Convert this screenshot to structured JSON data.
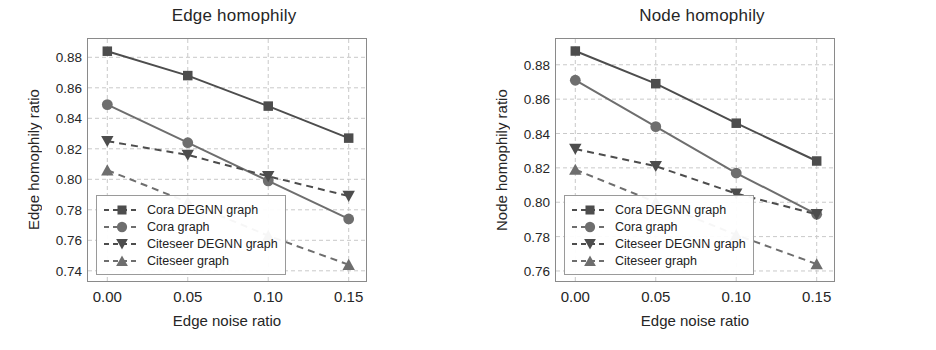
{
  "figure": {
    "panels": [
      "edge",
      "node"
    ]
  },
  "chart_data": [
    {
      "type": "line",
      "id": "edge",
      "title": "Edge homophily",
      "xlabel": "Edge noise ratio",
      "ylabel": "Edge homophily ratio",
      "x": [
        0.0,
        0.05,
        0.1,
        0.15
      ],
      "xticks": [
        "0.00",
        "0.05",
        "0.10",
        "0.15"
      ],
      "yticks": [
        "0.74",
        "0.76",
        "0.78",
        "0.80",
        "0.82",
        "0.84",
        "0.86",
        "0.88"
      ],
      "ylim": [
        0.732,
        0.892
      ],
      "xlim": [
        -0.012,
        0.162
      ],
      "grid": true,
      "legend_position": "lower left",
      "series": [
        {
          "name": "Cora DEGNN graph",
          "values": [
            0.884,
            0.868,
            0.848,
            0.827
          ],
          "marker": "square",
          "linestyle": "solid",
          "color": "#4d4d4d"
        },
        {
          "name": "Cora graph",
          "values": [
            0.849,
            0.824,
            0.799,
            0.774
          ],
          "marker": "circle",
          "linestyle": "solid",
          "color": "#6e6e6e"
        },
        {
          "name": "Citeseer DEGNN graph",
          "values": [
            0.825,
            0.816,
            0.802,
            0.789
          ],
          "marker": "triangle-down",
          "linestyle": "dashed",
          "color": "#4d4d4d"
        },
        {
          "name": "Citeseer graph",
          "values": [
            0.806,
            0.785,
            0.763,
            0.744
          ],
          "marker": "triangle-up",
          "linestyle": "dashed",
          "color": "#6e6e6e"
        }
      ]
    },
    {
      "type": "line",
      "id": "node",
      "title": "Node homophily",
      "xlabel": "Edge noise ratio",
      "ylabel": "Node homophily ratio",
      "x": [
        0.0,
        0.05,
        0.1,
        0.15
      ],
      "xticks": [
        "0.00",
        "0.05",
        "0.10",
        "0.15"
      ],
      "yticks": [
        "0.76",
        "0.78",
        "0.80",
        "0.82",
        "0.84",
        "0.86",
        "0.88"
      ],
      "ylim": [
        0.753,
        0.895
      ],
      "xlim": [
        -0.012,
        0.162
      ],
      "grid": true,
      "legend_position": "lower left",
      "series": [
        {
          "name": "Cora DEGNN graph",
          "values": [
            0.888,
            0.869,
            0.846,
            0.824
          ],
          "marker": "square",
          "linestyle": "solid",
          "color": "#4d4d4d"
        },
        {
          "name": "Cora graph",
          "values": [
            0.871,
            0.844,
            0.817,
            0.793
          ],
          "marker": "circle",
          "linestyle": "solid",
          "color": "#6e6e6e"
        },
        {
          "name": "Citeseer DEGNN graph",
          "values": [
            0.831,
            0.821,
            0.805,
            0.793
          ],
          "marker": "triangle-down",
          "linestyle": "dashed",
          "color": "#4d4d4d"
        },
        {
          "name": "Citeseer graph",
          "values": [
            0.819,
            0.8,
            0.781,
            0.764
          ],
          "marker": "triangle-up",
          "linestyle": "dashed",
          "color": "#6e6e6e"
        }
      ]
    }
  ],
  "style": {
    "grid_color": "#c9c9c9",
    "axis_color": "#8a8a8a",
    "text_color": "#262626",
    "background": "#ffffff"
  }
}
